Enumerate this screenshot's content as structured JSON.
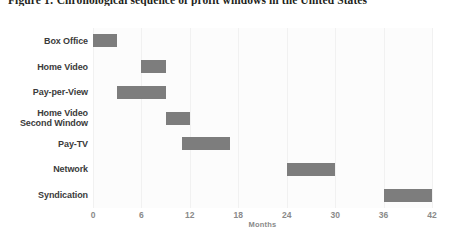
{
  "figure": {
    "title": "Figure 1: Chronological sequence of profit windows in the United States"
  },
  "chart_data": {
    "type": "bar",
    "orientation": "horizontal",
    "subtype": "gantt-range",
    "title": "Figure 1: Chronological sequence of profit windows in the United States",
    "xlabel": "Months",
    "ylabel": "",
    "xlim": [
      0,
      42
    ],
    "xticks": [
      0,
      6,
      12,
      18,
      24,
      30,
      36,
      42
    ],
    "xtick_labels": [
      "0",
      "6",
      "12",
      "18",
      "24",
      "30",
      "36",
      "42"
    ],
    "grid": true,
    "grid_axis": "x",
    "legend": false,
    "bar_color": "#7d7d7d",
    "panel_color": "#fcfcfc",
    "gridline_color": "#f1f1f1",
    "categories": [
      "Box Office",
      "Home Video",
      "Pay-per-View",
      "Home Video Second Window",
      "Pay-TV",
      "Network",
      "Syndication"
    ],
    "category_lines": [
      [
        "Box Office"
      ],
      [
        "Home Video"
      ],
      [
        "Pay-per-View"
      ],
      [
        "Home Video",
        "Second Window"
      ],
      [
        "Pay-TV"
      ],
      [
        "Network"
      ],
      [
        "Syndication"
      ]
    ],
    "bars": [
      {
        "label": "Box Office",
        "start": 0,
        "end": 3,
        "duration": 3
      },
      {
        "label": "Home Video",
        "start": 6,
        "end": 9,
        "duration": 3
      },
      {
        "label": "Pay-per-View",
        "start": 3,
        "end": 9,
        "duration": 6
      },
      {
        "label": "Home Video Second Window",
        "start": 9,
        "end": 12,
        "duration": 3
      },
      {
        "label": "Pay-TV",
        "start": 11,
        "end": 17,
        "duration": 6
      },
      {
        "label": "Network",
        "start": 24,
        "end": 30,
        "duration": 6
      },
      {
        "label": "Syndication",
        "start": 36,
        "end": 42,
        "duration": 6
      }
    ]
  }
}
